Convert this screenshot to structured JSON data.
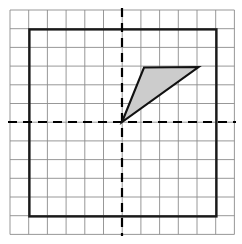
{
  "figure": {
    "canvas": {
      "width": 242,
      "height": 244,
      "background": "#ffffff"
    },
    "grid": {
      "description": "Light gray square lattice covering the figure",
      "origin_px": {
        "x": 122.0,
        "y": 122.0
      },
      "cell_size_px": 18.7,
      "columns": 12,
      "rows": 12,
      "x_start_px": 10.0,
      "y_start_px": 10.0,
      "x_end_px": 234.4,
      "y_end_px": 234.4,
      "line_color": "#8c8c8c",
      "line_width_px": 0.9,
      "visible": true
    },
    "axes": {
      "style": "dashed",
      "color": "#000000",
      "line_width_px": 2.2,
      "dash_pattern": "9 6",
      "x_axis": {
        "name": "horizontal-axis",
        "y_px": 122.0,
        "x_from_px": 8.0,
        "x_to_px": 236.0
      },
      "y_axis": {
        "name": "vertical-axis",
        "x_px": 122.0,
        "y_from_px": 8.0,
        "y_to_px": 236.0
      }
    },
    "bounding_square": {
      "name": "heavy-border-square",
      "left_px": 29.4,
      "top_px": 29.4,
      "right_px": 216.4,
      "bottom_px": 216.4,
      "side_cells": 10,
      "stroke_color": "#1a1a1a",
      "stroke_width_px": 2.4,
      "fill": "none"
    },
    "shaded_shape": {
      "name": "shaded-triangle",
      "type": "triangle",
      "fill_color": "#cccccc",
      "fill_opacity": 1,
      "stroke_color": "#111111",
      "stroke_width_px": 2.1,
      "vertices_px": [
        {
          "label": "origin-vertex",
          "x": 122.0,
          "y": 122.0
        },
        {
          "label": "upper-left-vertex",
          "x": 144.0,
          "y": 67.5
        },
        {
          "label": "upper-right-vertex",
          "x": 198.5,
          "y": 67.0
        }
      ],
      "vertices_grid": [
        {
          "label": "origin-vertex",
          "x": 0,
          "y": 0
        },
        {
          "label": "upper-left-vertex",
          "x": 1.2,
          "y": 2.9
        },
        {
          "label": "upper-right-vertex",
          "x": 4.1,
          "y": 2.9
        }
      ],
      "quadrant": "first"
    }
  }
}
